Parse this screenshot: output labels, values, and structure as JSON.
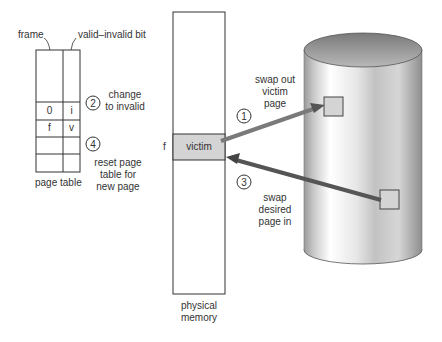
{
  "page_table": {
    "frame_label": "frame",
    "valid_bit_label": "valid–invalid bit",
    "title": "page table",
    "rows": [
      {
        "frame": "0",
        "bit": "i"
      },
      {
        "frame": "f",
        "bit": "v"
      }
    ]
  },
  "steps": [
    {
      "number": "1",
      "line1": "swap out",
      "line2": "victim",
      "line3": "page"
    },
    {
      "number": "2",
      "line1": "change",
      "line2": "to invalid"
    },
    {
      "number": "3",
      "line1": "swap",
      "line2": "desired",
      "line3": "page in"
    },
    {
      "number": "4",
      "line1": "reset page",
      "line2": "table for",
      "line3": "new page"
    }
  ],
  "memory": {
    "frame_marker": "f",
    "victim_label": "victim",
    "title_line1": "physical",
    "title_line2": "memory"
  },
  "colors": {
    "line": "#333333",
    "victim_fill": "#d4d4d4",
    "arrow_light": "#8a8a8a",
    "arrow_dark": "#4a4a4a"
  }
}
